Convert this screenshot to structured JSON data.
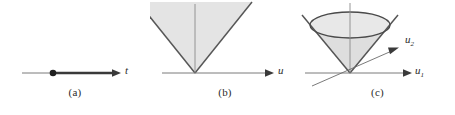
{
  "figure": {
    "background": "#ffffff",
    "line_color": "#4a4a4a",
    "edge_color": "#555555",
    "fill_color": "#e4e4e4",
    "text_color": "#2b2b2b"
  },
  "panels": [
    {
      "id": "a",
      "caption": "(a)",
      "axis_label": "t",
      "description": "one-dimensional ray: horizontal axis with marked origin point and thick half-line arrow",
      "geometry": {
        "axis_y": 73,
        "axis_x_start": 22,
        "axis_x_end": 120,
        "origin_dot_x": 53,
        "origin_dot_r": 3.2,
        "ray_end_x": 118
      }
    },
    {
      "id": "b",
      "caption": "(b)",
      "axis_label": "u",
      "description": "two-dimensional wedge: shaded inverted triangle cone with apex on the horizontal axis and a vertical axis through the apex",
      "geometry": {
        "axis_y": 73,
        "axis_x_start": 12,
        "axis_x_end": 124,
        "apex_x": 45,
        "apex_y": 73,
        "wedge_left_x": -10,
        "wedge_right_x": 100,
        "wedge_top_y": 2,
        "vertical_top_y": 4
      }
    },
    {
      "id": "c",
      "caption": "(c)",
      "axis_labels": [
        "u",
        "u"
      ],
      "axis_label_1": "u",
      "axis_label_1_sub": "1",
      "axis_label_2": "u",
      "axis_label_2_sub": "2",
      "description": "three-dimensional circular cone: shaded cone with elliptical rim, apex at origin, horizontal axis u1 and oblique axis u2",
      "geometry": {
        "axis_y": 73,
        "apex_x": 50,
        "apex_y": 73,
        "ellipse_cx": 50,
        "ellipse_cy": 25,
        "ellipse_rx": 40,
        "ellipse_ry": 13,
        "u1_x_start": 5,
        "u1_x_end": 112,
        "u2_start_x": 15,
        "u2_start_y": 84,
        "u2_end_x": 98,
        "u2_end_y": 48,
        "vertical_top_y": 3,
        "cone_extend_left_x": 2,
        "cone_extend_left_y": 10,
        "cone_extend_right_x": 98,
        "cone_extend_right_y": 10
      }
    }
  ]
}
